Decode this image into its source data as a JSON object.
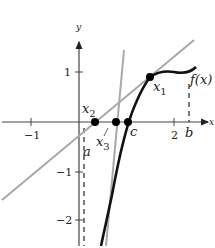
{
  "figure": {
    "axes": {
      "x_label": "x",
      "y_label": "y",
      "x_ticks": [
        {
          "value": -1,
          "label": "−1"
        },
        {
          "value": 2,
          "label": "2"
        }
      ],
      "y_ticks": [
        {
          "value": 1,
          "label": "1"
        },
        {
          "value": -1,
          "label": "−1"
        },
        {
          "value": -2,
          "label": "−2"
        }
      ]
    },
    "labels": {
      "x1": "x",
      "x1_sub": "1",
      "x2": "x",
      "x2_sub": "2",
      "x3": "x",
      "x3_sub": "3",
      "c": "c",
      "a": "a",
      "b": "b",
      "fx": "f(x)"
    },
    "colors": {
      "curve": "#111111",
      "tangent": "#a8a8a8",
      "axis": "#333333",
      "point": "#000000"
    }
  }
}
